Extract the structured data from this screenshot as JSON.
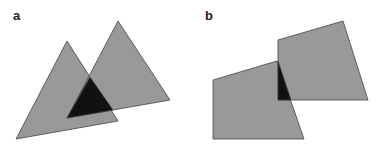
{
  "panels": [
    {
      "label": "a",
      "label_pos": [
        13,
        9
      ],
      "shapes": [
        {
          "name": "triangle-left",
          "points": "67,41 16,139 118,121"
        },
        {
          "name": "triangle-right",
          "points": "118,21 67,118 170,100"
        }
      ],
      "overlap": {
        "name": "triangle-overlap",
        "points": "90,77 67,118 113,110"
      }
    },
    {
      "label": "b",
      "label_pos": [
        205,
        9
      ],
      "shapes": [
        {
          "name": "quad-left",
          "points": "213,80 277,61 304,139 213,139"
        },
        {
          "name": "quad-right",
          "points": "278,40 343,21 368,100 278,100"
        }
      ],
      "overlap": {
        "name": "quad-overlap",
        "points": "278,61 278,100 291,100"
      }
    }
  ],
  "colors": {
    "fill": "#999999",
    "stroke": "#444444",
    "overlap": "#111111"
  }
}
